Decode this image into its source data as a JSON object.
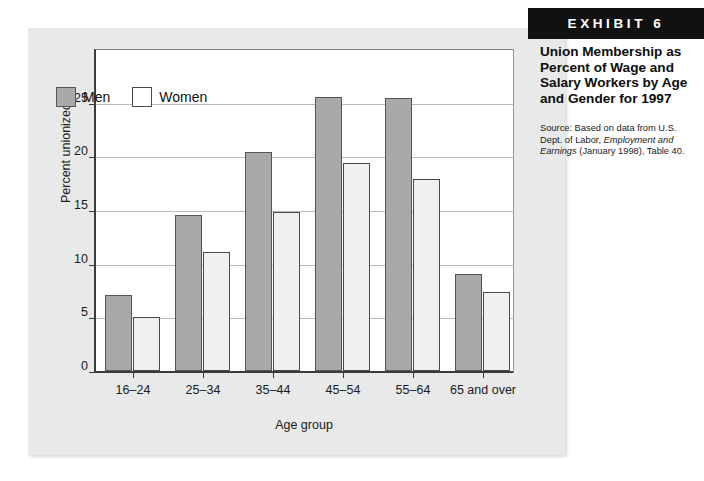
{
  "exhibit": {
    "badge": "EXHIBIT 6",
    "title": "Union Membership as Percent of Wage and Salary Workers by Age and Gender for 1997",
    "source_prefix": "Source: Based on data from U.S. Dept. of Labor, ",
    "source_italic": "Employment and Earnings",
    "source_suffix": " (January 1998), Table 40."
  },
  "chart_data": {
    "type": "bar",
    "title": "Union Membership as Percent of Wage and Salary Workers by Age and Gender for 1997",
    "xlabel": "Age group",
    "ylabel": "Percent unionized",
    "ylim": [
      0,
      30
    ],
    "yticks": [
      0,
      5,
      10,
      15,
      20,
      25
    ],
    "grid": true,
    "legend_position": "top-left-inside",
    "categories": [
      "16–24",
      "25–34",
      "35–44",
      "45–54",
      "55–64",
      "65 and over"
    ],
    "series": [
      {
        "name": "Men",
        "color": "#a9a9a9",
        "values": [
          7.1,
          14.5,
          20.4,
          25.5,
          25.4,
          9.0
        ]
      },
      {
        "name": "Women",
        "color": "#f0f0f0",
        "values": [
          5.0,
          11.1,
          14.8,
          19.4,
          17.9,
          7.4
        ]
      }
    ]
  }
}
